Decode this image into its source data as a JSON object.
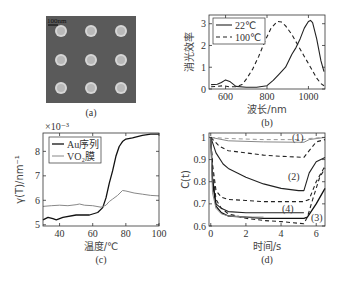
{
  "panels": {
    "a": {
      "label": "(a)",
      "scale_bar": "100nm",
      "grid": [
        3,
        3
      ]
    },
    "b": {
      "label": "(b)"
    },
    "c": {
      "label": "(c)"
    },
    "d": {
      "label": "(d)"
    }
  },
  "chart_data": [
    {
      "id": "a",
      "type": "image",
      "title": "",
      "description": "SEM image of 3x3 gold nanodisk array",
      "scale_bar_label": "100nm",
      "panel_label": "(a)"
    },
    {
      "id": "b",
      "type": "line",
      "panel_label": "(b)",
      "xlabel": "波长/nm",
      "ylabel": "消光效率",
      "xlim": [
        520,
        1080
      ],
      "ylim": [
        0,
        3.4
      ],
      "xticks": [
        600,
        800,
        1000
      ],
      "yticks": [
        0,
        1,
        2,
        3
      ],
      "legend_position": "upper-left",
      "series": [
        {
          "name": "22℃",
          "style": "solid",
          "x": [
            530,
            560,
            580,
            600,
            620,
            650,
            700,
            750,
            800,
            830,
            860,
            890,
            920,
            940,
            960,
            980,
            1000,
            1010,
            1020,
            1040,
            1060,
            1075
          ],
          "y": [
            0.2,
            0.22,
            0.3,
            0.42,
            0.35,
            0.12,
            0.08,
            0.08,
            0.15,
            0.4,
            0.7,
            1.0,
            1.6,
            1.9,
            2.3,
            2.8,
            3.1,
            3.15,
            3.05,
            2.3,
            1.3,
            0.8
          ]
        },
        {
          "name": "100℃",
          "style": "dashed",
          "x": [
            530,
            560,
            590,
            620,
            650,
            680,
            700,
            730,
            760,
            790,
            820,
            850,
            870,
            890,
            920,
            950,
            980,
            1010,
            1040,
            1060,
            1075
          ],
          "y": [
            0.1,
            0.12,
            0.15,
            0.1,
            0.1,
            0.2,
            0.45,
            0.9,
            1.5,
            2.2,
            2.8,
            3.1,
            3.08,
            2.9,
            2.5,
            2.0,
            1.5,
            1.0,
            0.5,
            0.25,
            0.15
          ]
        }
      ]
    },
    {
      "id": "c",
      "type": "line",
      "panel_label": "(c)",
      "xlabel": "温度/℃",
      "ylabel": "γ(T)/nm⁻¹",
      "multiplier": "×10⁻³",
      "xlim": [
        30,
        100
      ],
      "ylim": [
        4.95,
        8.75
      ],
      "xticks": [
        40,
        60,
        80,
        100
      ],
      "yticks": [
        5,
        6,
        7,
        8
      ],
      "legend_position": "upper-left",
      "series": [
        {
          "name": "Au序列",
          "style": "solid-dark",
          "x": [
            30,
            33,
            36,
            38,
            42,
            50,
            58,
            63,
            66,
            68,
            70,
            72,
            74,
            76,
            78,
            80,
            84,
            90,
            95,
            100
          ],
          "y": [
            5.2,
            5.3,
            5.25,
            5.2,
            5.3,
            5.4,
            5.4,
            5.5,
            5.7,
            6.1,
            6.7,
            7.2,
            7.8,
            8.2,
            8.4,
            8.5,
            8.55,
            8.65,
            8.7,
            8.7
          ]
        },
        {
          "name": "VO₂膜",
          "style": "solid-light",
          "x": [
            30,
            35,
            40,
            45,
            50,
            52,
            55,
            60,
            65,
            68,
            70,
            72,
            75,
            78,
            80,
            85,
            90,
            95,
            100
          ],
          "y": [
            5.75,
            5.78,
            5.8,
            5.78,
            5.82,
            5.85,
            5.8,
            5.78,
            5.72,
            5.8,
            5.95,
            6.05,
            6.2,
            6.4,
            6.38,
            6.3,
            6.25,
            6.2,
            6.18
          ]
        }
      ]
    },
    {
      "id": "d",
      "type": "line",
      "panel_label": "(d)",
      "xlabel": "时间/s",
      "ylabel": "C(t)",
      "xlim": [
        -0.1,
        6.5
      ],
      "ylim": [
        0.6,
        1.02
      ],
      "xticks": [
        0,
        2,
        4,
        6
      ],
      "yticks": [
        0.6,
        0.7,
        0.8,
        0.9,
        1
      ],
      "annotations": [
        "(1)",
        "(2)",
        "(3)",
        "(4)"
      ],
      "series": [
        {
          "name": "(1) solid",
          "style": "solid-light",
          "x": [
            0,
            1,
            3,
            5.3,
            5.6,
            6.5
          ],
          "y": [
            1.0,
            0.985,
            0.98,
            0.978,
            0.99,
            1.0
          ]
        },
        {
          "name": "(1) dashed",
          "style": "dashed-light",
          "x": [
            0,
            1,
            3,
            5.3,
            5.6,
            6.5
          ],
          "y": [
            1.0,
            0.995,
            0.99,
            0.99,
            0.995,
            1.0
          ]
        },
        {
          "name": "dashed upper",
          "style": "dashed",
          "x": [
            0,
            0.5,
            1,
            2,
            3,
            4,
            5.3,
            5.6,
            6,
            6.5
          ],
          "y": [
            1.0,
            0.96,
            0.94,
            0.93,
            0.92,
            0.915,
            0.91,
            0.94,
            0.98,
            0.99
          ]
        },
        {
          "name": "(2)",
          "style": "solid",
          "x": [
            0,
            0.3,
            0.7,
            1,
            2,
            3,
            4,
            5,
            5.3,
            5.6,
            6,
            6.5
          ],
          "y": [
            1.0,
            0.93,
            0.88,
            0.86,
            0.82,
            0.79,
            0.77,
            0.76,
            0.76,
            0.84,
            0.89,
            0.91
          ]
        },
        {
          "name": "(4) dashed",
          "style": "dashed",
          "x": [
            0,
            0.1,
            0.3,
            0.6,
            1,
            2,
            3,
            5.3,
            5.6,
            6,
            6.5
          ],
          "y": [
            1.0,
            0.88,
            0.76,
            0.73,
            0.72,
            0.715,
            0.71,
            0.71,
            0.72,
            0.8,
            0.87
          ]
        },
        {
          "name": "(4) solid",
          "style": "solid",
          "x": [
            0,
            0.1,
            0.3,
            0.6,
            1,
            2,
            3,
            5.3
          ],
          "y": [
            1.0,
            0.82,
            0.7,
            0.68,
            0.665,
            0.66,
            0.66,
            0.66
          ]
        },
        {
          "name": "(3) solid",
          "style": "solid-dark",
          "x": [
            0,
            0.1,
            0.3,
            0.6,
            1,
            2,
            3,
            5.3,
            5.5,
            6,
            6.5
          ],
          "y": [
            1.0,
            0.8,
            0.69,
            0.66,
            0.645,
            0.64,
            0.635,
            0.635,
            0.64,
            0.7,
            0.77
          ]
        },
        {
          "name": "(3) dashed",
          "style": "dashed",
          "x": [
            0,
            0.1,
            0.3,
            0.6,
            1,
            2,
            3,
            4,
            5.3,
            5.5,
            5.8,
            6.2,
            6.5
          ],
          "y": [
            1.0,
            0.85,
            0.72,
            0.68,
            0.655,
            0.635,
            0.625,
            0.62,
            0.61,
            0.64,
            0.72,
            0.82,
            0.86
          ]
        },
        {
          "name": "light solid low",
          "style": "solid-light",
          "x": [
            0,
            0.1,
            0.3,
            0.6,
            1,
            2,
            3
          ],
          "y": [
            1.0,
            0.75,
            0.68,
            0.655,
            0.645,
            0.64,
            0.64
          ]
        }
      ]
    }
  ]
}
